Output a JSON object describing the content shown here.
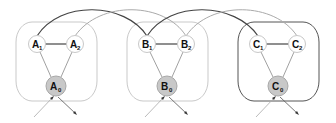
{
  "diagram": {
    "groups": [
      {
        "id": "A",
        "border_color": "#bdbdbd",
        "nodes": [
          {
            "id": "A1",
            "letter": "A",
            "sub": "1",
            "cx": 37,
            "cy": 44,
            "fill": "#ffffff"
          },
          {
            "id": "A2",
            "letter": "A",
            "sub": "2",
            "cx": 75,
            "cy": 44,
            "fill": "#ffffff"
          },
          {
            "id": "A0",
            "letter": "A",
            "sub": "0",
            "cx": 56,
            "cy": 86,
            "fill": "#c8c8c8"
          }
        ]
      },
      {
        "id": "B",
        "border_color": "#bdbdbd",
        "nodes": [
          {
            "id": "B1",
            "letter": "B",
            "sub": "1",
            "cx": 147,
            "cy": 44,
            "fill": "#ffffff"
          },
          {
            "id": "B2",
            "letter": "B",
            "sub": "2",
            "cx": 186,
            "cy": 44,
            "fill": "#ffffff"
          },
          {
            "id": "B0",
            "letter": "B",
            "sub": "0",
            "cx": 167,
            "cy": 86,
            "fill": "#c8c8c8"
          }
        ]
      },
      {
        "id": "C",
        "border_color": "#555555",
        "nodes": [
          {
            "id": "C1",
            "letter": "C",
            "sub": "1",
            "cx": 258,
            "cy": 44,
            "fill": "#ffffff"
          },
          {
            "id": "C2",
            "letter": "C",
            "sub": "2",
            "cx": 297,
            "cy": 44,
            "fill": "#ffffff"
          },
          {
            "id": "C0",
            "letter": "C",
            "sub": "0",
            "cx": 278,
            "cy": 86,
            "fill": "#c8c8c8"
          }
        ]
      }
    ],
    "arcs": [
      {
        "from": "A1",
        "to": "B1",
        "color": "#444444"
      },
      {
        "from": "A2",
        "to": "B2",
        "color": "#aaaaaa"
      },
      {
        "from": "B1",
        "to": "C1",
        "color": "#444444"
      },
      {
        "from": "B2",
        "to": "C2",
        "color": "#aaaaaa"
      }
    ],
    "colors": {
      "dark_edge": "#444444",
      "light_edge": "#aaaaaa",
      "node_stroke": "#c8c8c8",
      "root_fill": "#c8c8c8"
    }
  }
}
